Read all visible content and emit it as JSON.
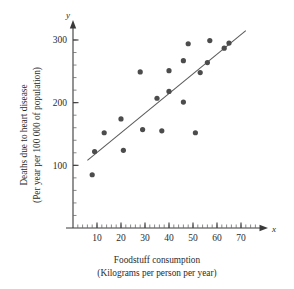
{
  "chart_data": {
    "type": "scatter",
    "title": "",
    "xlabel": "Foodstuff consumption",
    "xlabel_units": "(Kilograms per person per year)",
    "ylabel": "Deaths due to heart disease",
    "ylabel_units": "(Per year per 100 000 of population)",
    "x_axis_symbol": "x",
    "y_axis_symbol": "y",
    "xlim": [
      0,
      76
    ],
    "ylim": [
      0,
      320
    ],
    "x_ticks": [
      10,
      20,
      30,
      40,
      50,
      60,
      70
    ],
    "y_ticks": [
      100,
      200,
      300
    ],
    "x_minor_step": 2,
    "y_minor_step": 20,
    "grid": false,
    "legend": false,
    "points": [
      {
        "x": 8,
        "y": 85
      },
      {
        "x": 9,
        "y": 122
      },
      {
        "x": 13,
        "y": 152
      },
      {
        "x": 20,
        "y": 174
      },
      {
        "x": 21,
        "y": 124
      },
      {
        "x": 28,
        "y": 249
      },
      {
        "x": 29,
        "y": 157
      },
      {
        "x": 35,
        "y": 207
      },
      {
        "x": 37,
        "y": 155
      },
      {
        "x": 40,
        "y": 218
      },
      {
        "x": 40,
        "y": 251
      },
      {
        "x": 46,
        "y": 201
      },
      {
        "x": 46,
        "y": 267
      },
      {
        "x": 48,
        "y": 294
      },
      {
        "x": 51,
        "y": 152
      },
      {
        "x": 53,
        "y": 248
      },
      {
        "x": 56,
        "y": 264
      },
      {
        "x": 57,
        "y": 299
      },
      {
        "x": 63,
        "y": 287
      },
      {
        "x": 65,
        "y": 295
      }
    ],
    "fit_line": {
      "x1": 6,
      "y1": 108,
      "x2": 72,
      "y2": 315
    }
  }
}
